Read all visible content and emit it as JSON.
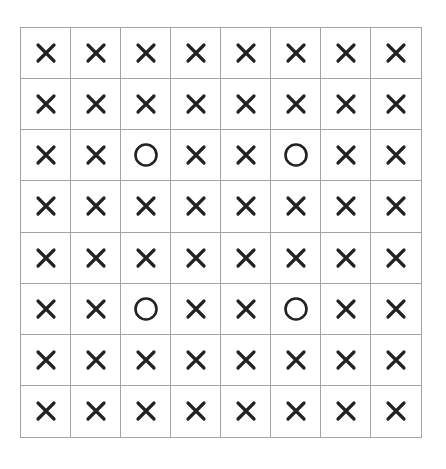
{
  "board": {
    "rows": 8,
    "cols": 8,
    "cells": [
      [
        "X",
        "X",
        "X",
        "X",
        "X",
        "X",
        "X",
        "X"
      ],
      [
        "X",
        "X",
        "X",
        "X",
        "X",
        "X",
        "X",
        "X"
      ],
      [
        "X",
        "X",
        "O",
        "X",
        "X",
        "O",
        "X",
        "X"
      ],
      [
        "X",
        "X",
        "X",
        "X",
        "X",
        "X",
        "X",
        "X"
      ],
      [
        "X",
        "X",
        "X",
        "X",
        "X",
        "X",
        "X",
        "X"
      ],
      [
        "X",
        "X",
        "O",
        "X",
        "X",
        "O",
        "X",
        "X"
      ],
      [
        "X",
        "X",
        "X",
        "X",
        "X",
        "X",
        "X",
        "X"
      ],
      [
        "X",
        "X",
        "X",
        "X",
        "X",
        "X",
        "X",
        "X"
      ]
    ],
    "colors": {
      "grid_line": "#a3a3a3",
      "mark": "#222222",
      "background": "#ffffff"
    },
    "icons": {
      "X": "cross-icon",
      "O": "circle-icon"
    }
  }
}
